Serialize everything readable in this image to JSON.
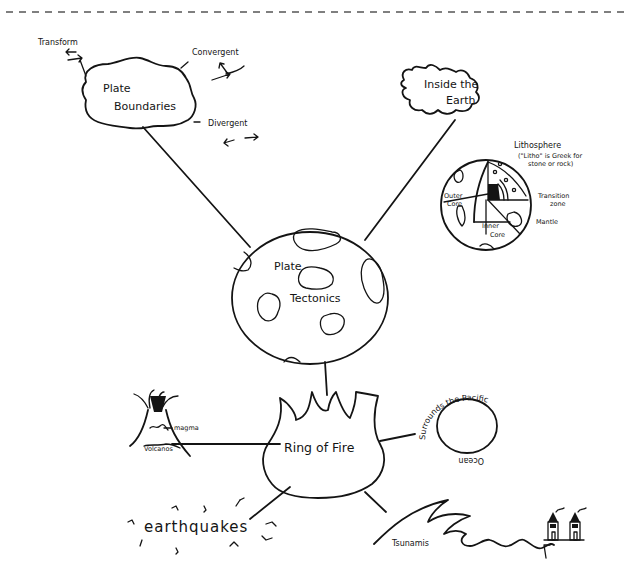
{
  "diagram": {
    "type": "concept-map",
    "central_node": {
      "label_line1": "Plate",
      "label_line2": "Tectonics"
    },
    "nodes": {
      "plate_boundaries": {
        "label_line1": "Plate",
        "label_line2": "Boundaries",
        "children": {
          "transform": "Transform",
          "convergent": "Convergent",
          "divergent": "Divergent"
        }
      },
      "inside_earth": {
        "label_line1": "Inside the",
        "label_line2": "Earth",
        "layers": {
          "lithosphere": "Lithosphere",
          "lithosphere_note_line1": "(\"Litho\" is Greek for",
          "lithosphere_note_line2": "stone or rock)",
          "transition_line1": "Transition",
          "transition_line2": "zone",
          "mantle": "Mantle",
          "outer_core_line1": "Outer",
          "outer_core_line2": "Core",
          "inner_core_line1": "Inner",
          "inner_core_line2": "Core"
        }
      },
      "ring_of_fire": {
        "label": "Ring of Fire",
        "children": {
          "volcanos": "Volcanos",
          "magma": "magma",
          "pacific": "Surrounds the Pacific Ocean",
          "pacific_top": "Surrounds the Pacific",
          "pacific_bottom": "Ocean",
          "earthquakes": "earthquakes",
          "tsunamis": "Tsunamis"
        }
      }
    },
    "colors": {
      "ink": "#141414",
      "paper": "#ffffff",
      "dash": "#555555"
    }
  }
}
